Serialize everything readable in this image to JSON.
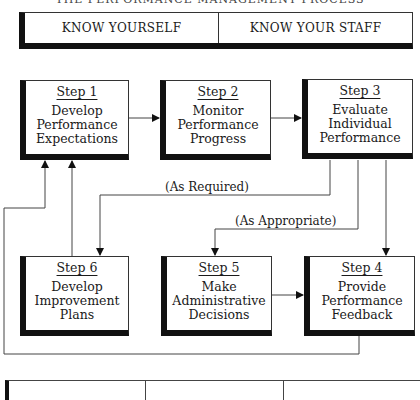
{
  "title": "THE PERFORMANCE MANAGEMENT PROCESS",
  "top_bar": {
    "cells": [
      "KNOW YOURSELF",
      "KNOW YOUR STAFF"
    ]
  },
  "steps": [
    {
      "id": 1,
      "num": "Step 1",
      "label": "Develop\nPerformance\nExpectations"
    },
    {
      "id": 2,
      "num": "Step 2",
      "label": "Monitor\nPerformance\nProgress"
    },
    {
      "id": 3,
      "num": "Step 3",
      "label": "Evaluate\nIndividual\nPerformance"
    },
    {
      "id": 4,
      "num": "Step 4",
      "label": "Provide\nPerformance\nFeedback"
    },
    {
      "id": 5,
      "num": "Step 5",
      "label": "Make\nAdministrative\nDecisions"
    },
    {
      "id": 6,
      "num": "Step 6",
      "label": "Develop\nImprovement\nPlans"
    }
  ],
  "annotations": {
    "as_required": "(As Required)",
    "as_appropriate": "(As Appropriate)"
  },
  "connections": [
    {
      "from": "Step 1",
      "to": "Step 2"
    },
    {
      "from": "Step 2",
      "to": "Step 3"
    },
    {
      "from": "Step 3",
      "to": "Step 6",
      "label": "(As Required)"
    },
    {
      "from": "Step 3",
      "to": "Step 5",
      "label": "(As Appropriate)"
    },
    {
      "from": "Step 3",
      "to": "Step 4"
    },
    {
      "from": "Step 5",
      "to": "Step 4"
    },
    {
      "from": "Step 6",
      "to": "Step 1"
    },
    {
      "from": "Step 4",
      "to": "Step 1"
    }
  ],
  "bottom_bar": {
    "cells": [
      "",
      "",
      ""
    ]
  }
}
